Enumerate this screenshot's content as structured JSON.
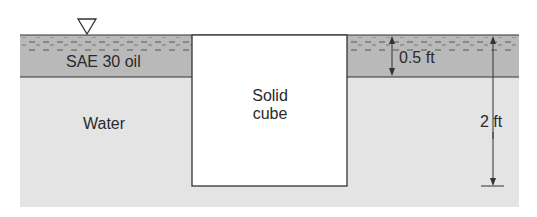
{
  "diagram": {
    "type": "fluid-statics-tank",
    "free_surface_symbol": "▽",
    "layers": [
      {
        "name": "oil",
        "label": "SAE 30 oil",
        "color": "#b9b9b9"
      },
      {
        "name": "water",
        "label": "Water",
        "color": "#e4e4e4"
      }
    ],
    "object": {
      "label_line1": "Solid",
      "label_line2": "cube",
      "color": "#ffffff"
    },
    "dimensions": {
      "oil_depth": "0.5 ft",
      "cube_submerged_depth": "2 ft"
    }
  }
}
